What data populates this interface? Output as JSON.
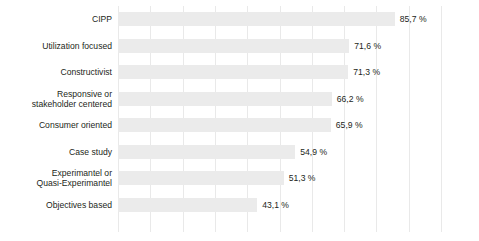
{
  "chart_data": {
    "type": "bar",
    "orientation": "horizontal",
    "title": "",
    "subtitle": "",
    "xlabel": "",
    "ylabel": "",
    "xlim": [
      0,
      100
    ],
    "grid": true,
    "legend": false,
    "legend_position": "none",
    "value_suffix": " %",
    "decimal_separator": ",",
    "xticks": [
      0,
      10,
      20,
      30,
      40,
      50,
      60,
      70,
      80,
      90,
      100
    ],
    "categories": [
      "CIPP",
      "Utilization focused",
      "Constructivist",
      "Responsive or\nstakeholder centered",
      "Consumer oriented",
      "Case study",
      "Experimantel or\nQuasi-Experimantel",
      "Objectives based"
    ],
    "values": [
      85.7,
      71.6,
      71.3,
      66.2,
      65.9,
      54.9,
      51.3,
      43.1
    ],
    "value_labels": [
      "85,7 %",
      "71,6 %",
      "71,3 %",
      "66,2 %",
      "65,9 %",
      "54,9 %",
      "51,3 %",
      "43,1 %"
    ],
    "colors": {
      "bar": "#ebebeb",
      "gridline": "#e9e9e9",
      "text": "#231f20",
      "background": "#ffffff"
    }
  }
}
